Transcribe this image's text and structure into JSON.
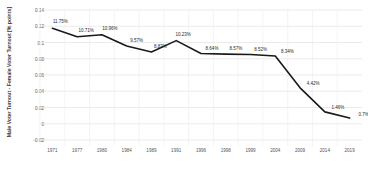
{
  "chart_data": {
    "type": "line",
    "title": "",
    "subtitle": "",
    "xlabel": "",
    "ylabel": "Male Voter Turnout - Female Voter Turnout [% points]",
    "x": [
      "1971",
      "1977",
      "1980",
      "1984",
      "1989",
      "1991",
      "1996",
      "1998",
      "1999",
      "2004",
      "2009",
      "2014",
      "2019"
    ],
    "categories": [
      "1971",
      "1977",
      "1980",
      "1984",
      "1989",
      "1991",
      "1996",
      "1998",
      "1999",
      "2004",
      "2009",
      "2014",
      "2019"
    ],
    "values": [
      0.1175,
      0.1071,
      0.1096,
      0.0957,
      0.0883,
      0.1023,
      0.0864,
      0.0857,
      0.0852,
      0.0834,
      0.0442,
      0.0146,
      0.007
    ],
    "point_labels": [
      "11.75%",
      "10.71%",
      "10.96%",
      "9.57%",
      "8.83%",
      "10.23%",
      "8.64%",
      "8.57%",
      "8.52%",
      "8.34%",
      "4.42%",
      "1.46%",
      "0.7%"
    ],
    "ytick_labels": [
      "0.14",
      "0.12",
      "0.1",
      "0.08",
      "0.06",
      "0.04",
      "0.02",
      "0",
      "-0.02"
    ],
    "ytick_values": [
      0.14,
      0.12,
      0.1,
      0.08,
      0.06,
      0.04,
      0.02,
      0,
      -0.02
    ],
    "ylim": [
      -0.02,
      0.14
    ],
    "grid": true,
    "legend": "none",
    "series": [
      {
        "name": "Male Voter Turnout - Female Voter Turnout",
        "values": [
          0.1175,
          0.1071,
          0.1096,
          0.0957,
          0.0883,
          0.1023,
          0.0864,
          0.0857,
          0.0852,
          0.0834,
          0.0442,
          0.0146,
          0.007
        ],
        "color": "#1a1a1a"
      }
    ],
    "colors": {
      "line": "#1a1a1a",
      "grid": "#e2e2e2",
      "axis_text": "#555555",
      "label_text": "#2b2b2b",
      "background": "#ffffff"
    }
  }
}
